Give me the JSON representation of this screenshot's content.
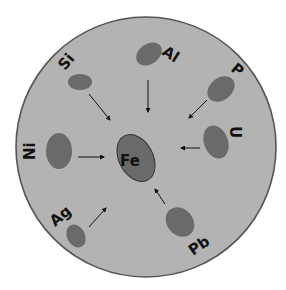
{
  "diagram": {
    "background_color": "#ffffff",
    "circle": {
      "fill": "#b3b3b3",
      "stroke": "#555555"
    },
    "particle_color": "#6a6a6a",
    "center": {
      "label": "Fe"
    },
    "elements": [
      {
        "label": "Al"
      },
      {
        "label": "Si"
      },
      {
        "label": "P"
      },
      {
        "label": "Ni"
      },
      {
        "label": "U"
      },
      {
        "label": "Ag"
      },
      {
        "label": "Pb"
      }
    ]
  }
}
